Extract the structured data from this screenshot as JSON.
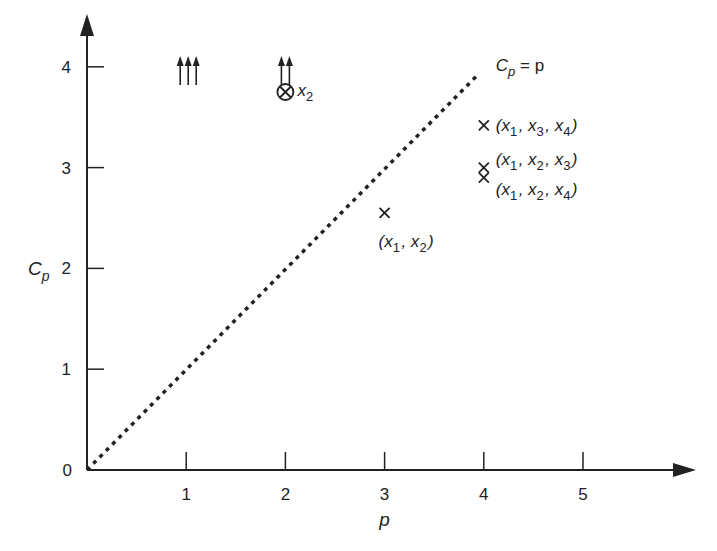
{
  "chart_data": {
    "type": "scatter",
    "title": "",
    "xlabel": "p",
    "ylabel": "C_p",
    "xlim": [
      0,
      6
    ],
    "ylim": [
      0,
      4.3
    ],
    "grid": false,
    "x_ticks": [
      "1",
      "2",
      "3",
      "4",
      "5"
    ],
    "y_ticks": [
      "0",
      "1",
      "2",
      "3",
      "4"
    ],
    "reference_line": {
      "label_main": "C",
      "label_sub": "p",
      "label_rest": " = p",
      "from": [
        0,
        0
      ],
      "to": [
        4,
        4
      ],
      "style": "dotted"
    },
    "points": [
      {
        "p": 2,
        "cp": 3.75,
        "marker": "circle-x",
        "label": [
          [
            "x",
            "2"
          ]
        ]
      },
      {
        "p": 3,
        "cp": 2.55,
        "marker": "x",
        "label": [
          [
            "(x",
            "1"
          ],
          [
            ", x",
            "2"
          ],
          [
            ")",
            ""
          ]
        ]
      },
      {
        "p": 4,
        "cp": 3.42,
        "marker": "x",
        "label": [
          [
            "(x",
            "1"
          ],
          [
            ", x",
            "3"
          ],
          [
            ", x",
            "4"
          ],
          [
            ")",
            ""
          ]
        ]
      },
      {
        "p": 4,
        "cp": 3.0,
        "marker": "x",
        "label": [
          [
            "(x",
            "1"
          ],
          [
            ", x",
            "2"
          ],
          [
            ", x",
            "3"
          ],
          [
            ")",
            ""
          ]
        ]
      },
      {
        "p": 4,
        "cp": 2.9,
        "marker": "x",
        "label": [
          [
            "(x",
            "1"
          ],
          [
            ", x",
            "2"
          ],
          [
            ", x",
            "4"
          ],
          [
            ")",
            ""
          ]
        ]
      }
    ],
    "off_scale_arrows": [
      {
        "p": 1,
        "count": 3,
        "meaning": "values above plotted range"
      },
      {
        "p": 2,
        "count": 2,
        "meaning": "values above plotted range"
      }
    ]
  }
}
